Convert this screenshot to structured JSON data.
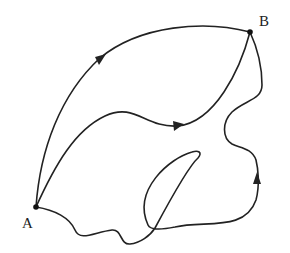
{
  "diagram": {
    "type": "path-diagram",
    "points": [
      {
        "id": "A",
        "label": "A",
        "x": 36,
        "y": 207
      },
      {
        "id": "B",
        "label": "B",
        "x": 250,
        "y": 32
      }
    ],
    "paths": [
      {
        "id": "upper",
        "name": "upper arc path",
        "arrow_at": [
          100,
          58
        ]
      },
      {
        "id": "middle",
        "name": "middle wavy path",
        "arrow_at": [
          178,
          125
        ]
      },
      {
        "id": "lower",
        "name": "lower looping path",
        "arrow_at": [
          257,
          183
        ]
      }
    ],
    "colors": {
      "stroke": "#222222",
      "background": "#ffffff"
    }
  }
}
